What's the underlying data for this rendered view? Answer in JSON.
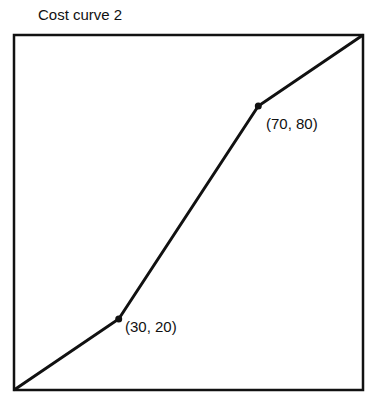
{
  "title": "Cost curve 2",
  "chart_data": {
    "type": "line",
    "title": "Cost curve 2",
    "xlabel": "",
    "ylabel": "",
    "xlim": [
      0,
      100
    ],
    "ylim": [
      0,
      100
    ],
    "grid": false,
    "series": [
      {
        "name": "Cost curve 2",
        "points": [
          [
            0,
            0
          ],
          [
            30,
            20
          ],
          [
            70,
            80
          ],
          [
            100,
            100
          ]
        ]
      }
    ],
    "annotations": [
      {
        "text": "(30, 20)",
        "x": 30,
        "y": 20
      },
      {
        "text": "(70, 80)",
        "x": 70,
        "y": 80
      }
    ]
  },
  "labels": {
    "p1": "(30, 20)",
    "p2": "(70, 80)"
  },
  "colors": {
    "line": "#111111",
    "frame": "#111111"
  }
}
